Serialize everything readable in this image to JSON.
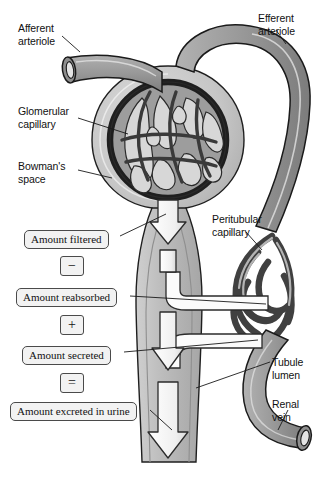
{
  "figure": {
    "background_color": "#ffffff",
    "vessel_fill": "#9a9a9a",
    "vessel_outline": "#1a1a1a",
    "capsule_fill": "#c8c8c8",
    "tubule_fill": "#bdbdbd",
    "arrow_fill": "#f4f4f4",
    "arrow_outline": "#2b2b2b",
    "leader_color": "#1a1a1a"
  },
  "anatomy_labels": [
    {
      "id": "afferent-arteriole",
      "text": "Afferent\narteriole",
      "x": 18,
      "y": 22
    },
    {
      "id": "efferent-arteriole",
      "text": "Efferent\narteriole",
      "x": 258,
      "y": 12
    },
    {
      "id": "glomerular-capillary",
      "text": "Glomerular\ncapillary",
      "x": 18,
      "y": 105
    },
    {
      "id": "bowmans-space",
      "text": "Bowman's\nspace",
      "x": 18,
      "y": 160
    },
    {
      "id": "peritubular-capillary",
      "text": "Peritubular\ncapillary",
      "x": 212,
      "y": 213
    },
    {
      "id": "tubule-lumen",
      "text": "Tubule\nlumen",
      "x": 272,
      "y": 356
    },
    {
      "id": "renal-vein",
      "text": "Renal\nvein",
      "x": 272,
      "y": 398
    }
  ],
  "flow_equation": [
    {
      "id": "amount-filtered",
      "kind": "term",
      "text": "Amount filtered",
      "x": 24,
      "y": 230,
      "width": 94
    },
    {
      "id": "operator-minus",
      "kind": "operator",
      "text": "−",
      "x": 60,
      "y": 256
    },
    {
      "id": "amount-reabsorbed",
      "kind": "term",
      "text": "Amount reabsorbed",
      "x": 16,
      "y": 288,
      "width": 112
    },
    {
      "id": "operator-plus",
      "kind": "operator",
      "text": "+",
      "x": 60,
      "y": 315
    },
    {
      "id": "amount-secreted",
      "kind": "term",
      "text": "Amount secreted",
      "x": 22,
      "y": 346,
      "width": 99
    },
    {
      "id": "operator-equals",
      "kind": "operator",
      "text": "=",
      "x": 60,
      "y": 373
    },
    {
      "id": "amount-excreted",
      "kind": "term",
      "text": "Amount excreted in urine",
      "x": 10,
      "y": 402,
      "width": 140
    }
  ],
  "flow_arrows": [
    {
      "id": "filtration-arrow",
      "direction": "down",
      "meaning": "filtration into Bowman's space"
    },
    {
      "id": "tubule-flow-arrow",
      "direction": "down",
      "meaning": "fluid flow down tubule"
    },
    {
      "id": "secretion-flow-arrow",
      "direction": "down",
      "meaning": "flow after secretion"
    },
    {
      "id": "excretion-arrow",
      "direction": "down",
      "meaning": "excretion in urine"
    }
  ]
}
